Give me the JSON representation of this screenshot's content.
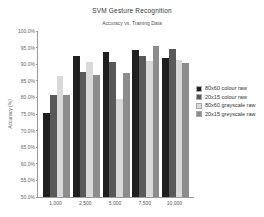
{
  "chart_data": {
    "type": "bar",
    "title": "SVM Gesture Recognition",
    "subtitle": "Accuracy vs. Training Data",
    "ylabel": "Accuracy (%)",
    "xlabel": "",
    "categories": [
      "1,000",
      "2,500",
      "5,000",
      "7,500",
      "10,000"
    ],
    "series": [
      {
        "name": "80x60 colour raw",
        "color": "#1f1f1f",
        "values": [
          75.2,
          92.4,
          93.7,
          94.3,
          91.8
        ]
      },
      {
        "name": "20x15 colour raw",
        "color": "#595959",
        "values": [
          80.7,
          87.6,
          90.7,
          92.4,
          94.6
        ]
      },
      {
        "name": "80x60 grayscale raw",
        "color": "#d9d9d9",
        "values": [
          86.4,
          90.6,
          79.5,
          90.9,
          91.2
        ]
      },
      {
        "name": "20x15 greyscale raw",
        "color": "#8c8c8c",
        "values": [
          80.7,
          86.7,
          87.4,
          95.5,
          90.3
        ]
      }
    ],
    "ylim": [
      50,
      100
    ],
    "yticks": [
      "100.0%",
      "95.0%",
      "90.0%",
      "85.0%",
      "80.0%",
      "75.0%",
      "70.0%",
      "65.0%",
      "60.0%",
      "55.0%",
      "50.0%"
    ],
    "grid": false,
    "legend_position": "right",
    "colors": {
      "background": "#ffffff",
      "axis": "#999999",
      "tick_text": "#666666",
      "title_text": "#333333"
    }
  }
}
